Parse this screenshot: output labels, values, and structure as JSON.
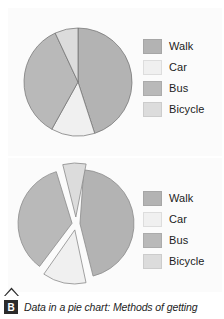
{
  "colors": {
    "background": "#ffffff",
    "panel": "#fbfbfb",
    "walk": "#b3b3b3",
    "car": "#f0f0f0",
    "bus": "#b9b9b9",
    "bicycle": "#dcdcdc",
    "slice_stroke": "#6e6e6e",
    "text": "#1c1c1c",
    "badge_bg": "#2b2b2b",
    "badge_fg": "#ffffff"
  },
  "legend": {
    "items": [
      {
        "label": "Walk",
        "swatch_name": "legend-swatch-walk",
        "color": "#b3b3b3"
      },
      {
        "label": "Car",
        "swatch_name": "legend-swatch-car",
        "color": "#f0f0f0"
      },
      {
        "label": "Bus",
        "swatch_name": "legend-swatch-bus",
        "color": "#b9b9b9"
      },
      {
        "label": "Bicycle",
        "swatch_name": "legend-swatch-bicycle",
        "color": "#dcdcdc"
      }
    ]
  },
  "caption": {
    "badge": "B",
    "text": "Data in a pie chart: Methods of getting"
  },
  "chart_data": [
    {
      "type": "pie",
      "title": "",
      "id": "pie-chart-standard",
      "exploded": false,
      "legend_position": "right",
      "start_angle_deg": -90,
      "direction": "clockwise",
      "categories": [
        "Walk",
        "Car",
        "Bus",
        "Bicycle"
      ],
      "values": [
        45,
        13,
        35,
        7
      ],
      "slices": [
        {
          "label": "Walk",
          "value": 45,
          "color": "#b3b3b3",
          "start_deg": -90,
          "sweep_deg": 162
        },
        {
          "label": "Car",
          "value": 13,
          "color": "#f0f0f0",
          "start_deg": 72,
          "sweep_deg": 47
        },
        {
          "label": "Bus",
          "value": 35,
          "color": "#b9b9b9",
          "start_deg": 119,
          "sweep_deg": 126
        },
        {
          "label": "Bicycle",
          "value": 7,
          "color": "#dcdcdc",
          "start_deg": 245,
          "sweep_deg": 25
        }
      ],
      "geometry": {
        "center_x": 60,
        "center_y": 60,
        "radius": 54
      }
    },
    {
      "type": "pie",
      "title": "",
      "id": "pie-chart-exploded",
      "exploded": true,
      "legend_position": "right",
      "start_angle_deg": -90,
      "direction": "clockwise",
      "categories": [
        "Walk",
        "Car",
        "Bus",
        "Bicycle"
      ],
      "values": [
        45,
        13,
        35,
        7
      ],
      "slices": [
        {
          "label": "Walk",
          "value": 45,
          "color": "#b3b3b3",
          "start_deg": -86,
          "sweep_deg": 162,
          "explode": 4
        },
        {
          "label": "Car",
          "value": 13,
          "color": "#f0f0f0",
          "start_deg": 78,
          "sweep_deg": 47,
          "explode": 6
        },
        {
          "label": "Bus",
          "value": 35,
          "color": "#b9b9b9",
          "start_deg": 127,
          "sweep_deg": 126,
          "explode": 4
        },
        {
          "label": "Bicycle",
          "value": 7,
          "color": "#dcdcdc",
          "start_deg": 256,
          "sweep_deg": 25,
          "explode": 7
        }
      ],
      "geometry": {
        "center_x": 66,
        "center_y": 66,
        "radius": 54
      }
    }
  ]
}
